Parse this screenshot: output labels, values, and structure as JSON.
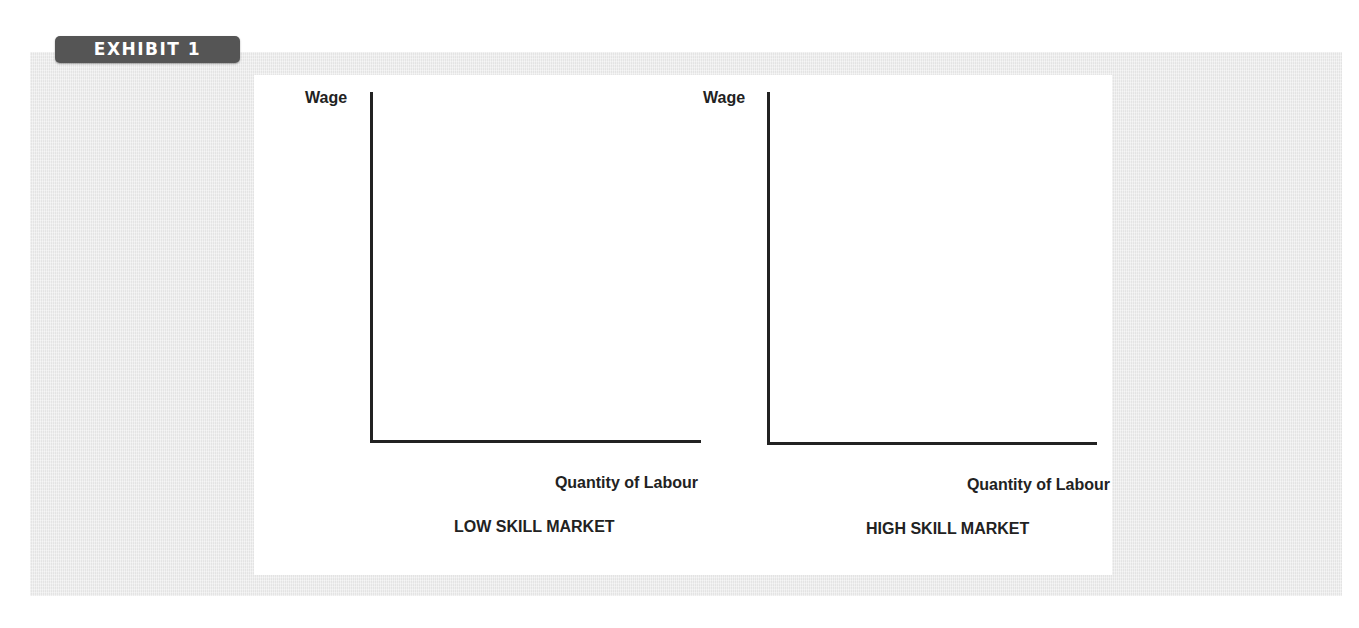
{
  "exhibit": {
    "label": "EXHIBIT 1"
  },
  "diagrams": [
    {
      "title": "LOW SKILL MARKET",
      "y_axis_label": "Wage",
      "x_axis_label": "Quantity of Labour"
    },
    {
      "title": "HIGH SKILL MARKET",
      "y_axis_label": "Wage",
      "x_axis_label": "Quantity of Labour"
    }
  ],
  "colors": {
    "tag_background": "#555555",
    "tag_text": "#ffffff",
    "band_background": "#ececec",
    "panel_background": "#ffffff",
    "axis": "#222222",
    "text": "#222222"
  }
}
